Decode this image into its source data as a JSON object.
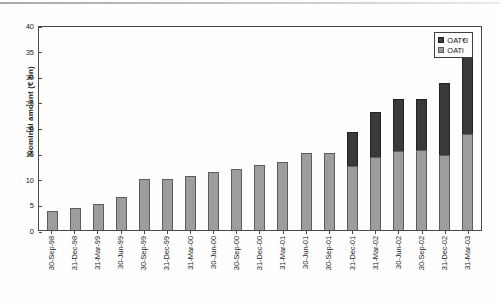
{
  "chart_data": {
    "type": "bar",
    "subtype": "stacked-vertical",
    "title": "",
    "xlabel": "",
    "ylabel": "Nominal amount (€ bn)",
    "ylim": [
      0,
      40
    ],
    "yticks": [
      0,
      5,
      10,
      15,
      20,
      25,
      30,
      35,
      40
    ],
    "ytick_labels": [
      "0",
      "5",
      "10",
      "15",
      "20",
      "25",
      "30",
      "35",
      "40"
    ],
    "grid": false,
    "legend_position": "top-right",
    "categories": [
      "30-Sep-98",
      "31-Dec-98",
      "31-Mar-99",
      "30-Jun-99",
      "30-Sep-99",
      "31-Dec-99",
      "31-Mar-00",
      "30-Jun-00",
      "30-Sep-00",
      "31-Dec-00",
      "31-Mar-01",
      "30-Jun-01",
      "30-Sep-01",
      "31-Dec-01",
      "31-Mar-02",
      "30-Jun-02",
      "30-Sep-02",
      "31-Dec-02",
      "31-Mar-03"
    ],
    "series": [
      {
        "name": "OATi",
        "color": "#9d9d9d",
        "values": [
          3.7,
          4.3,
          5.1,
          6.5,
          10.0,
          10.0,
          10.6,
          11.3,
          12.0,
          12.7,
          13.2,
          15.1,
          15.1,
          12.5,
          14.3,
          15.5,
          15.6,
          14.7,
          18.8
        ]
      },
      {
        "name": "OAT€i",
        "color": "#3a3a3a",
        "values": [
          0,
          0,
          0,
          0,
          0,
          0,
          0,
          0,
          0,
          0,
          0,
          0,
          0,
          6.7,
          8.8,
          10.0,
          9.9,
          13.9,
          14.9
        ]
      }
    ],
    "totals": [
      3.7,
      4.3,
      5.1,
      6.5,
      10.0,
      10.0,
      10.6,
      11.3,
      12.0,
      12.7,
      13.2,
      15.1,
      15.1,
      19.2,
      23.1,
      25.5,
      25.5,
      28.6,
      33.7
    ]
  },
  "legend": {
    "items": [
      {
        "label": "OAT€i",
        "swatch": "dark"
      },
      {
        "label": "OATi",
        "swatch": "light"
      }
    ]
  }
}
